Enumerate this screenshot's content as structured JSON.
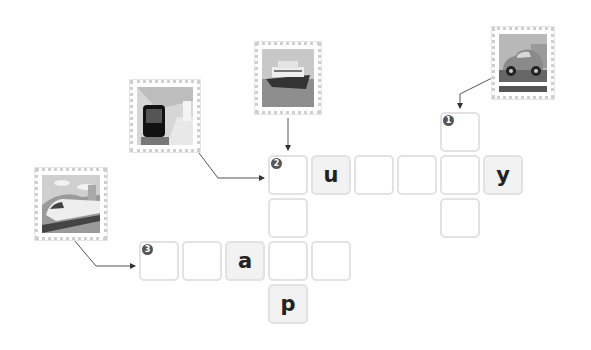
{
  "puzzle": {
    "clues": [
      {
        "number": "1",
        "image": "car-icon",
        "direction": "down"
      },
      {
        "number": "2",
        "image": "ship-icon",
        "direction": "across"
      },
      {
        "number": "2",
        "image": "subway-train-icon",
        "direction": "down"
      },
      {
        "number": "3",
        "image": "high-speed-train-icon",
        "direction": "across"
      }
    ],
    "cells": [
      {
        "id": "c1",
        "x": 440,
        "y": 112,
        "letter": "",
        "num": "1"
      },
      {
        "id": "c2",
        "x": 268,
        "y": 155,
        "letter": "",
        "num": "2"
      },
      {
        "id": "c3",
        "x": 311,
        "y": 155,
        "letter": "u",
        "num": ""
      },
      {
        "id": "c4",
        "x": 354,
        "y": 155,
        "letter": "",
        "num": ""
      },
      {
        "id": "c5",
        "x": 397,
        "y": 155,
        "letter": "",
        "num": ""
      },
      {
        "id": "c6",
        "x": 440,
        "y": 155,
        "letter": "",
        "num": ""
      },
      {
        "id": "c7",
        "x": 483,
        "y": 155,
        "letter": "y",
        "num": ""
      },
      {
        "id": "c8",
        "x": 268,
        "y": 198,
        "letter": "",
        "num": ""
      },
      {
        "id": "c9",
        "x": 440,
        "y": 198,
        "letter": "",
        "num": ""
      },
      {
        "id": "c10",
        "x": 139,
        "y": 241,
        "letter": "",
        "num": "3"
      },
      {
        "id": "c11",
        "x": 182,
        "y": 241,
        "letter": "",
        "num": ""
      },
      {
        "id": "c12",
        "x": 225,
        "y": 241,
        "letter": "a",
        "num": ""
      },
      {
        "id": "c13",
        "x": 268,
        "y": 241,
        "letter": "",
        "num": ""
      },
      {
        "id": "c14",
        "x": 311,
        "y": 241,
        "letter": "",
        "num": ""
      },
      {
        "id": "c15",
        "x": 268,
        "y": 284,
        "letter": "p",
        "num": ""
      }
    ]
  }
}
